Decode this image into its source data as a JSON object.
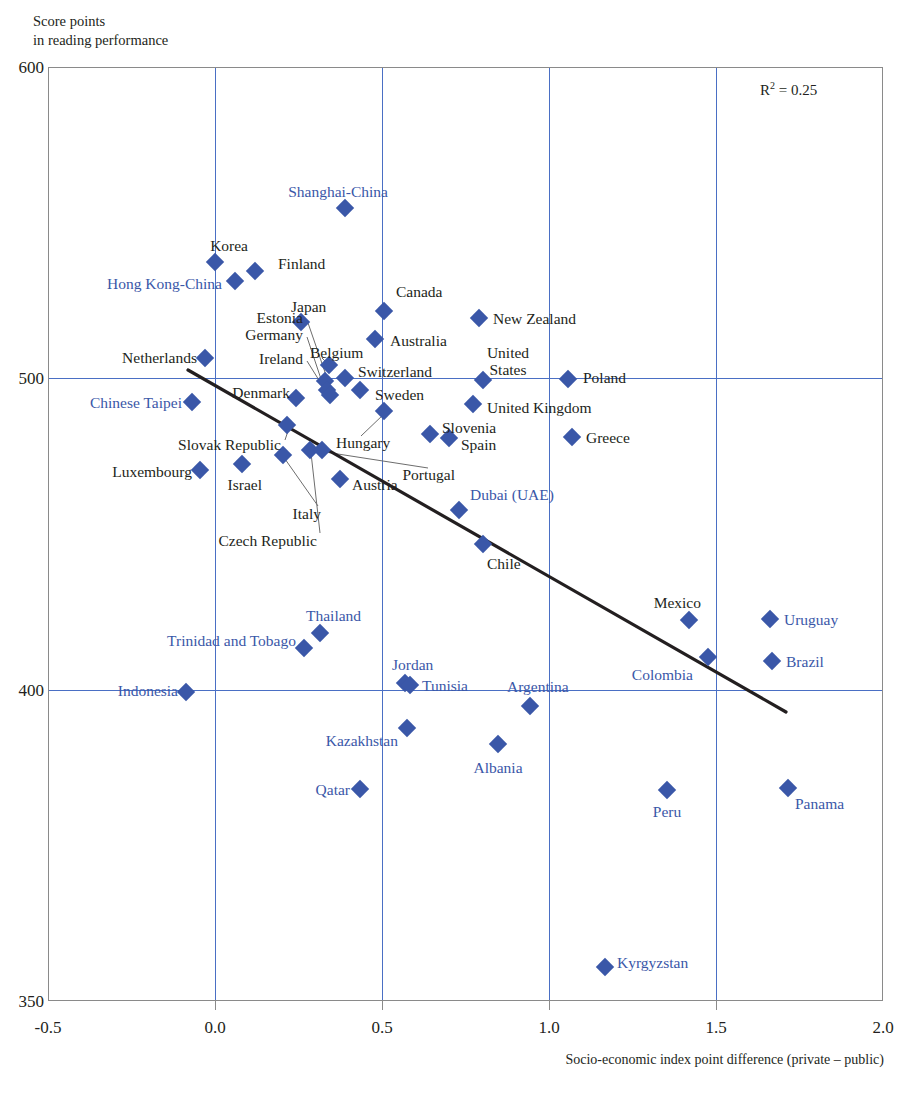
{
  "axes": {
    "y_caption": "Score points\nin reading performance",
    "x_caption": "Socio-economic index point difference (private – public)",
    "y_ticks": [
      "600",
      "500",
      "400",
      "350"
    ],
    "x_ticks": [
      "-0.5",
      "0.0",
      "0.5",
      "1.0",
      "1.5",
      "2.0"
    ],
    "r_squared_label": "R",
    "r_squared_exp": "2",
    "r_squared_value": "= 0.25"
  },
  "colors": {
    "marker": "#3a57a8",
    "partner_label": "#3a57a8",
    "oecd_label": "#231f20",
    "grid": "#4a6fc4",
    "trend": "#231f20"
  },
  "chart_data": {
    "type": "scatter",
    "title": "",
    "xlabel": "Socio-economic index point difference (private – public)",
    "ylabel": "Score points in reading performance",
    "xlim": [
      -0.5,
      2.0
    ],
    "ylim": [
      350,
      600
    ],
    "grid": true,
    "legend": "none",
    "annotations": [
      "R2 = 0.25"
    ],
    "trendline": {
      "x0": -0.08,
      "y0": 503,
      "x1": 1.71,
      "y1": 393
    },
    "points": [
      {
        "label": "Shanghai-China",
        "x": 0.35,
        "y": 556,
        "group": "partner"
      },
      {
        "label": "Korea",
        "x": 0.02,
        "y": 539,
        "group": "oecd"
      },
      {
        "label": "Hong Kong-China",
        "x": 0.08,
        "y": 533,
        "group": "partner"
      },
      {
        "label": "Finland",
        "x": 0.14,
        "y": 536,
        "group": "oecd"
      },
      {
        "label": "Canada",
        "x": 0.53,
        "y": 524,
        "group": "oecd"
      },
      {
        "label": "New Zealand",
        "x": 0.76,
        "y": 521,
        "group": "oecd"
      },
      {
        "label": "Japan",
        "x": 0.27,
        "y": 520,
        "group": "oecd"
      },
      {
        "label": "Australia",
        "x": 0.46,
        "y": 515,
        "group": "oecd"
      },
      {
        "label": "Netherlands",
        "x": 0.22,
        "y": 508,
        "group": "oecd"
      },
      {
        "label": "Belgium",
        "x": 0.31,
        "y": 506,
        "group": "oecd"
      },
      {
        "label": "Estonia",
        "x": 0.3,
        "y": 501,
        "group": "oecd"
      },
      {
        "label": "Germany",
        "x": 0.3,
        "y": 498,
        "group": "oecd"
      },
      {
        "label": "Ireland",
        "x": 0.31,
        "y": 496,
        "group": "oecd"
      },
      {
        "label": "Switzerland",
        "x": 0.36,
        "y": 501,
        "group": "oecd"
      },
      {
        "label": "Poland",
        "x": 1.03,
        "y": 500,
        "group": "oecd"
      },
      {
        "label": "United States",
        "x": 0.8,
        "y": 500,
        "group": "oecd"
      },
      {
        "label": "Sweden",
        "x": 0.4,
        "y": 497,
        "group": "oecd"
      },
      {
        "label": "Denmark",
        "x": 0.24,
        "y": 495,
        "group": "oecd"
      },
      {
        "label": "Chinese Taipei",
        "x": 0.17,
        "y": 495,
        "group": "partner"
      },
      {
        "label": "United Kingdom",
        "x": 0.74,
        "y": 494,
        "group": "oecd"
      },
      {
        "label": "Hungary",
        "x": 0.49,
        "y": 494,
        "group": "oecd"
      },
      {
        "label": "Slovak Republic",
        "x": 0.22,
        "y": 490,
        "group": "oecd"
      },
      {
        "label": "Slovenia",
        "x": 0.64,
        "y": 489,
        "group": "oecd"
      },
      {
        "label": "Spain",
        "x": 0.7,
        "y": 488,
        "group": "oecd"
      },
      {
        "label": "Greece",
        "x": 1.05,
        "y": 487,
        "group": "oecd"
      },
      {
        "label": "Czech Republic",
        "x": 0.27,
        "y": 487,
        "group": "oecd"
      },
      {
        "label": "Israel",
        "x": 0.15,
        "y": 484,
        "group": "oecd"
      },
      {
        "label": "Luxembourg",
        "x": 0.2,
        "y": 484,
        "group": "oecd"
      },
      {
        "label": "Italy",
        "x": 0.33,
        "y": 483,
        "group": "oecd"
      },
      {
        "label": "Portugal",
        "x": 0.33,
        "y": 481,
        "group": "oecd"
      },
      {
        "label": "Austria",
        "x": 0.38,
        "y": 479,
        "group": "oecd"
      },
      {
        "label": "Dubai (UAE)",
        "x": 0.74,
        "y": 473,
        "group": "partner"
      },
      {
        "label": "Chile",
        "x": 0.78,
        "y": 465,
        "group": "oecd"
      },
      {
        "label": "Mexico",
        "x": 1.42,
        "y": 421,
        "group": "oecd"
      },
      {
        "label": "Uruguay",
        "x": 1.61,
        "y": 421,
        "group": "partner"
      },
      {
        "label": "Thailand",
        "x": 0.29,
        "y": 418,
        "group": "partner"
      },
      {
        "label": "Trinidad and Tobago",
        "x": 0.25,
        "y": 414,
        "group": "partner"
      },
      {
        "label": "Colombia",
        "x": 1.36,
        "y": 412,
        "group": "partner"
      },
      {
        "label": "Brazil",
        "x": 1.61,
        "y": 411,
        "group": "partner"
      },
      {
        "label": "Jordan",
        "x": 0.52,
        "y": 403,
        "group": "partner"
      },
      {
        "label": "Tunisia",
        "x": 0.54,
        "y": 402,
        "group": "partner"
      },
      {
        "label": "Indonesia",
        "x": -0.15,
        "y": 401,
        "group": "partner"
      },
      {
        "label": "Argentina",
        "x": 0.92,
        "y": 399,
        "group": "partner"
      },
      {
        "label": "Kazakhstan",
        "x": 0.55,
        "y": 393,
        "group": "partner"
      },
      {
        "label": "Albania",
        "x": 0.83,
        "y": 391,
        "group": "partner"
      },
      {
        "label": "Qatar",
        "x": 0.38,
        "y": 383,
        "group": "partner"
      },
      {
        "label": "Peru",
        "x": 1.36,
        "y": 382,
        "group": "partner"
      },
      {
        "label": "Panama",
        "x": 1.72,
        "y": 383,
        "group": "partner"
      },
      {
        "label": "Kyrgyzstan",
        "x": 1.17,
        "y": 356,
        "group": "partner"
      }
    ]
  },
  "markers": [
    {
      "name": "shanghai-china",
      "x": 345,
      "y": 208
    },
    {
      "name": "korea",
      "x": 215,
      "y": 262
    },
    {
      "name": "hong-kong-china",
      "x": 235,
      "y": 281
    },
    {
      "name": "finland",
      "x": 255,
      "y": 271
    },
    {
      "name": "canada",
      "x": 384,
      "y": 311
    },
    {
      "name": "new-zealand",
      "x": 479,
      "y": 318
    },
    {
      "name": "japan",
      "x": 301,
      "y": 322
    },
    {
      "name": "australia",
      "x": 375,
      "y": 339
    },
    {
      "name": "netherlands",
      "x": 205,
      "y": 358
    },
    {
      "name": "belgium",
      "x": 329,
      "y": 365
    },
    {
      "name": "switzerland",
      "x": 345,
      "y": 378
    },
    {
      "name": "estonia",
      "x": 325,
      "y": 381
    },
    {
      "name": "germany",
      "x": 327,
      "y": 390
    },
    {
      "name": "ireland",
      "x": 330,
      "y": 395
    },
    {
      "name": "poland",
      "x": 568,
      "y": 379
    },
    {
      "name": "united-states",
      "x": 483,
      "y": 380
    },
    {
      "name": "sweden",
      "x": 360,
      "y": 390
    },
    {
      "name": "denmark",
      "x": 296,
      "y": 398
    },
    {
      "name": "chinese-taipei",
      "x": 192,
      "y": 402
    },
    {
      "name": "united-kingdom",
      "x": 473,
      "y": 404
    },
    {
      "name": "hungary",
      "x": 384,
      "y": 411
    },
    {
      "name": "slovak-republic",
      "x": 287,
      "y": 425
    },
    {
      "name": "slovenia",
      "x": 430,
      "y": 434
    },
    {
      "name": "spain",
      "x": 449,
      "y": 438
    },
    {
      "name": "greece",
      "x": 572,
      "y": 437
    },
    {
      "name": "czech-republic",
      "x": 310,
      "y": 450
    },
    {
      "name": "israel",
      "x": 242,
      "y": 464
    },
    {
      "name": "luxembourg",
      "x": 200,
      "y": 470
    },
    {
      "name": "italy",
      "x": 283,
      "y": 455
    },
    {
      "name": "portugal",
      "x": 322,
      "y": 450
    },
    {
      "name": "austria",
      "x": 340,
      "y": 479
    },
    {
      "name": "dubai-uae",
      "x": 459,
      "y": 510
    },
    {
      "name": "chile",
      "x": 483,
      "y": 544
    },
    {
      "name": "mexico",
      "x": 689,
      "y": 620
    },
    {
      "name": "uruguay",
      "x": 770,
      "y": 619
    },
    {
      "name": "thailand",
      "x": 320,
      "y": 633
    },
    {
      "name": "trinidad-and-tobago",
      "x": 304,
      "y": 648
    },
    {
      "name": "colombia",
      "x": 708,
      "y": 657
    },
    {
      "name": "brazil",
      "x": 772,
      "y": 661
    },
    {
      "name": "jordan",
      "x": 405,
      "y": 683
    },
    {
      "name": "tunisia",
      "x": 410,
      "y": 685
    },
    {
      "name": "indonesia",
      "x": 186,
      "y": 692
    },
    {
      "name": "argentina",
      "x": 530,
      "y": 706
    },
    {
      "name": "kazakhstan",
      "x": 407,
      "y": 728
    },
    {
      "name": "albania",
      "x": 498,
      "y": 744
    },
    {
      "name": "qatar",
      "x": 360,
      "y": 789
    },
    {
      "name": "peru",
      "x": 667,
      "y": 790
    },
    {
      "name": "panama",
      "x": 788,
      "y": 788
    },
    {
      "name": "kyrgyzstan",
      "x": 605,
      "y": 967
    }
  ],
  "labels": [
    {
      "name": "shanghai-china",
      "text": "Shanghai-China",
      "x": 388,
      "y": 191,
      "align": "r",
      "blue": true
    },
    {
      "name": "korea",
      "text": "Korea",
      "x": 248,
      "y": 245,
      "align": "r",
      "blue": false
    },
    {
      "name": "hong-kong-china",
      "text": "Hong Kong-China",
      "x": 222,
      "y": 283,
      "align": "r",
      "blue": true
    },
    {
      "name": "finland",
      "text": "Finland",
      "x": 278,
      "y": 263,
      "align": "l",
      "blue": false
    },
    {
      "name": "canada",
      "text": "Canada",
      "x": 396,
      "y": 291,
      "align": "l",
      "blue": false
    },
    {
      "name": "new-zealand",
      "text": "New Zealand",
      "x": 493,
      "y": 318,
      "align": "l",
      "blue": false
    },
    {
      "name": "japan",
      "text": "Japan",
      "x": 291,
      "y": 306,
      "align": "l",
      "blue": false
    },
    {
      "name": "australia",
      "text": "Australia",
      "x": 390,
      "y": 340,
      "align": "l",
      "blue": false
    },
    {
      "name": "netherlands",
      "text": "Netherlands",
      "x": 197,
      "y": 357,
      "align": "r",
      "blue": false
    },
    {
      "name": "belgium",
      "text": "Belgium",
      "x": 310,
      "y": 352,
      "align": "l",
      "blue": false
    },
    {
      "name": "estonia",
      "text": "Estonia",
      "x": 303,
      "y": 317,
      "align": "r",
      "blue": false
    },
    {
      "name": "germany",
      "text": "Germany",
      "x": 303,
      "y": 334,
      "align": "r",
      "blue": false
    },
    {
      "name": "ireland",
      "text": "Ireland",
      "x": 303,
      "y": 358,
      "align": "r",
      "blue": false
    },
    {
      "name": "switzerland",
      "text": "Switzerland",
      "x": 358,
      "y": 371,
      "align": "l",
      "blue": false
    },
    {
      "name": "poland",
      "text": "Poland",
      "x": 583,
      "y": 377,
      "align": "l",
      "blue": false
    },
    {
      "name": "united-states",
      "text": "United\nStates",
      "x": 508,
      "y": 361,
      "align": "c",
      "blue": false
    },
    {
      "name": "sweden",
      "text": "Sweden",
      "x": 375,
      "y": 394,
      "align": "l",
      "blue": false
    },
    {
      "name": "denmark",
      "text": "Denmark",
      "x": 290,
      "y": 392,
      "align": "r",
      "blue": false
    },
    {
      "name": "chinese-taipei",
      "text": "Chinese Taipei",
      "x": 182,
      "y": 402,
      "align": "r",
      "blue": true
    },
    {
      "name": "united-kingdom",
      "text": "United Kingdom",
      "x": 487,
      "y": 407,
      "align": "l",
      "blue": false
    },
    {
      "name": "hungary",
      "text": "Hungary",
      "x": 336,
      "y": 442,
      "align": "l",
      "blue": false
    },
    {
      "name": "slovak-republic",
      "text": "Slovak Republic",
      "x": 281,
      "y": 444,
      "align": "r",
      "blue": false
    },
    {
      "name": "slovenia",
      "text": "Slovenia",
      "x": 442,
      "y": 427,
      "align": "l",
      "blue": false
    },
    {
      "name": "spain",
      "text": "Spain",
      "x": 461,
      "y": 444,
      "align": "l",
      "blue": false
    },
    {
      "name": "greece",
      "text": "Greece",
      "x": 586,
      "y": 437,
      "align": "l",
      "blue": false
    },
    {
      "name": "czech-republic",
      "text": "Czech Republic",
      "x": 317,
      "y": 540,
      "align": "r",
      "blue": false
    },
    {
      "name": "israel",
      "text": "Israel",
      "x": 262,
      "y": 484,
      "align": "r",
      "blue": false
    },
    {
      "name": "luxembourg",
      "text": "Luxembourg",
      "x": 192,
      "y": 471,
      "align": "r",
      "blue": false
    },
    {
      "name": "italy",
      "text": "Italy",
      "x": 321,
      "y": 513,
      "align": "r",
      "blue": false
    },
    {
      "name": "portugal",
      "text": "Portugal",
      "x": 455,
      "y": 474,
      "align": "r",
      "blue": false
    },
    {
      "name": "austria",
      "text": "Austria",
      "x": 352,
      "y": 484,
      "align": "l",
      "blue": false
    },
    {
      "name": "dubai-uae",
      "text": "Dubai (UAE)",
      "x": 470,
      "y": 494,
      "align": "l",
      "blue": true
    },
    {
      "name": "chile",
      "text": "Chile",
      "x": 487,
      "y": 563,
      "align": "l",
      "blue": false
    },
    {
      "name": "mexico",
      "text": "Mexico",
      "x": 701,
      "y": 602,
      "align": "r",
      "blue": false
    },
    {
      "name": "uruguay",
      "text": "Uruguay",
      "x": 784,
      "y": 619,
      "align": "l",
      "blue": true
    },
    {
      "name": "thailand",
      "text": "Thailand",
      "x": 306,
      "y": 615,
      "align": "l",
      "blue": true
    },
    {
      "name": "trinidad-and-tobago",
      "text": "Trinidad and Tobago",
      "x": 296,
      "y": 640,
      "align": "r",
      "blue": true
    },
    {
      "name": "colombia",
      "text": "Colombia",
      "x": 693,
      "y": 674,
      "align": "r",
      "blue": true
    },
    {
      "name": "brazil",
      "text": "Brazil",
      "x": 786,
      "y": 661,
      "align": "l",
      "blue": true
    },
    {
      "name": "jordan",
      "text": "Jordan",
      "x": 392,
      "y": 664,
      "align": "l",
      "blue": true
    },
    {
      "name": "tunisia",
      "text": "Tunisia",
      "x": 422,
      "y": 685,
      "align": "l",
      "blue": true
    },
    {
      "name": "indonesia",
      "text": "Indonesia",
      "x": 178,
      "y": 690,
      "align": "r",
      "blue": true
    },
    {
      "name": "argentina",
      "text": "Argentina",
      "x": 507,
      "y": 686,
      "align": "l",
      "blue": true
    },
    {
      "name": "kazakhstan",
      "text": "Kazakhstan",
      "x": 398,
      "y": 740,
      "align": "r",
      "blue": true
    },
    {
      "name": "albania",
      "text": "Albania",
      "x": 498,
      "y": 767,
      "align": "c",
      "blue": true
    },
    {
      "name": "qatar",
      "text": "Qatar",
      "x": 350,
      "y": 789,
      "align": "r",
      "blue": true
    },
    {
      "name": "peru",
      "text": "Peru",
      "x": 667,
      "y": 811,
      "align": "c",
      "blue": true
    },
    {
      "name": "panama",
      "text": "Panama",
      "x": 795,
      "y": 803,
      "align": "l",
      "blue": true
    },
    {
      "name": "kyrgyzstan",
      "text": "Kyrgyzstan",
      "x": 617,
      "y": 962,
      "align": "l",
      "blue": true
    }
  ],
  "leaders": [
    {
      "name": "estonia-leader",
      "x1": 307,
      "y1": 320,
      "x2": 327,
      "y2": 378
    },
    {
      "name": "germany-leader",
      "x1": 307,
      "y1": 337,
      "x2": 324,
      "y2": 388
    },
    {
      "name": "ireland-leader",
      "x1": 307,
      "y1": 361,
      "x2": 327,
      "y2": 393
    },
    {
      "name": "belgium-leader",
      "x1": 322,
      "y1": 358,
      "x2": 330,
      "y2": 366
    },
    {
      "name": "denmark-leader",
      "x1": 294,
      "y1": 395,
      "x2": 302,
      "y2": 397
    },
    {
      "name": "hungary-leader",
      "x1": 361,
      "y1": 436,
      "x2": 384,
      "y2": 414
    },
    {
      "name": "portugal-leader",
      "x1": 428,
      "y1": 468,
      "x2": 325,
      "y2": 452
    },
    {
      "name": "czech-leader",
      "x1": 320,
      "y1": 533,
      "x2": 311,
      "y2": 453
    },
    {
      "name": "italy-leader",
      "x1": 318,
      "y1": 506,
      "x2": 285,
      "y2": 459
    },
    {
      "name": "slovak-leader",
      "x1": 285,
      "y1": 440,
      "x2": 289,
      "y2": 428
    }
  ],
  "gridlines": {
    "vertical_x": [
      215,
      382,
      549,
      716
    ],
    "horizontal_y": [
      378,
      690
    ]
  }
}
